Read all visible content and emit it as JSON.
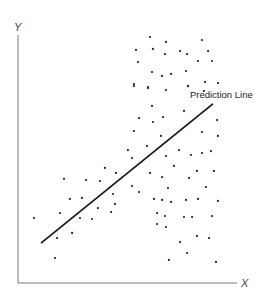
{
  "chart_data": {
    "type": "scatter",
    "title": "",
    "xlabel": "X",
    "ylabel": "Y",
    "xlim": [
      0,
      100
    ],
    "ylim": [
      0,
      100
    ],
    "grid": false,
    "legend": null,
    "ticks": false,
    "annotations": [
      {
        "text": "Prediction Line",
        "x": 78.5,
        "y": 74.5
      }
    ],
    "series": [
      {
        "name": "observations",
        "kind": "points",
        "points": [
          [
            60.3,
            99.2
          ],
          [
            67.6,
            97.2
          ],
          [
            84.0,
            98.0
          ],
          [
            53.9,
            94.0
          ],
          [
            61.6,
            94.4
          ],
          [
            67.1,
            92.3
          ],
          [
            74.0,
            93.5
          ],
          [
            77.2,
            92.3
          ],
          [
            86.8,
            93.5
          ],
          [
            54.8,
            89.1
          ],
          [
            82.2,
            89.5
          ],
          [
            88.6,
            89.5
          ],
          [
            61.2,
            85.1
          ],
          [
            65.8,
            83.5
          ],
          [
            69.9,
            84.3
          ],
          [
            76.7,
            85.5
          ],
          [
            52.9,
            80.2
          ],
          [
            59.4,
            79.0
          ],
          [
            77.6,
            79.4
          ],
          [
            85.4,
            81.0
          ],
          [
            91.3,
            80.6
          ],
          [
            52.9,
            79.4
          ],
          [
            59.4,
            78.6
          ],
          [
            67.6,
            77.8
          ],
          [
            77.6,
            79.4
          ],
          [
            84.9,
            77.4
          ],
          [
            61.2,
            71.4
          ],
          [
            75.8,
            69.4
          ],
          [
            55.3,
            66.5
          ],
          [
            61.6,
            64.9
          ],
          [
            66.2,
            66.9
          ],
          [
            90.9,
            65.7
          ],
          [
            52.9,
            61.3
          ],
          [
            65.3,
            59.3
          ],
          [
            84.0,
            60.9
          ],
          [
            91.3,
            59.3
          ],
          [
            50.2,
            53.6
          ],
          [
            52.1,
            50.4
          ],
          [
            58.9,
            55.2
          ],
          [
            67.6,
            51.2
          ],
          [
            73.5,
            53.6
          ],
          [
            79.0,
            51.6
          ],
          [
            84.0,
            52.4
          ],
          [
            88.1,
            53.2
          ],
          [
            71.2,
            47.2
          ],
          [
            60.3,
            44.4
          ],
          [
            65.8,
            42.7
          ],
          [
            78.1,
            42.3
          ],
          [
            81.7,
            45.2
          ],
          [
            89.5,
            45.2
          ],
          [
            52.1,
            39.1
          ],
          [
            55.3,
            36.7
          ],
          [
            68.5,
            38.3
          ],
          [
            85.8,
            38.7
          ],
          [
            62.1,
            33.9
          ],
          [
            65.8,
            33.5
          ],
          [
            69.9,
            32.7
          ],
          [
            76.7,
            33.5
          ],
          [
            82.2,
            33.9
          ],
          [
            91.3,
            33.1
          ],
          [
            63.5,
            28.2
          ],
          [
            67.1,
            27.0
          ],
          [
            75.8,
            26.6
          ],
          [
            79.5,
            26.6
          ],
          [
            88.6,
            27.0
          ],
          [
            63.5,
            23.8
          ],
          [
            67.6,
            22.6
          ],
          [
            81.7,
            19.0
          ],
          [
            87.2,
            18.1
          ],
          [
            74.0,
            16.5
          ],
          [
            77.2,
            12.1
          ],
          [
            68.9,
            9.3
          ],
          [
            90.4,
            8.5
          ],
          [
            39.7,
            46.4
          ],
          [
            44.7,
            44.4
          ],
          [
            21.0,
            42.0
          ],
          [
            31.1,
            41.5
          ],
          [
            37.4,
            41.1
          ],
          [
            23.7,
            33.9
          ],
          [
            29.2,
            34.3
          ],
          [
            43.4,
            35.9
          ],
          [
            44.3,
            31.9
          ],
          [
            36.5,
            30.2
          ],
          [
            42.5,
            28.6
          ],
          [
            19.2,
            28.2
          ],
          [
            7.3,
            26.2
          ],
          [
            28.3,
            26.2
          ],
          [
            33.8,
            25.8
          ],
          [
            24.7,
            20.2
          ],
          [
            17.8,
            18.1
          ],
          [
            16.9,
            10.1
          ]
        ]
      },
      {
        "name": "Prediction Line",
        "kind": "line",
        "x": [
          10.5,
          89.0
        ],
        "y": [
          16.1,
          72.2
        ]
      }
    ],
    "axes": {
      "origin_px": [
        18,
        283
      ],
      "x_end_px": 237,
      "y_end_px": 35
    }
  },
  "labels": {
    "x_axis": "X",
    "y_axis": "Y",
    "line": "Prediction Line"
  },
  "colors": {
    "axis": "#777777",
    "points": "#222222",
    "line": "#1a1a1a",
    "background": "#ffffff"
  }
}
